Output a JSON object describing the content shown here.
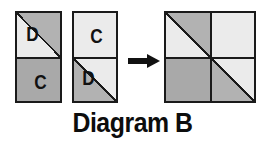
{
  "caption": {
    "text": "Diagram B"
  },
  "colors": {
    "outline": "#1a1a1a",
    "light": "#ebebeb",
    "mid_gray": "#b2b2b2",
    "dark_gray": "#a9a9a9",
    "background": "#ffffff",
    "text": "#111111"
  },
  "arrow": {
    "name": "right-arrow",
    "direction": "right"
  },
  "blocks": [
    {
      "id": "piece-1",
      "role": "input-left",
      "cells": [
        {
          "id": "piece-1-top",
          "position": "top",
          "pattern": "diagonal",
          "upper_left_shade": "light",
          "lower_right_shade": "mid_gray",
          "label": "D",
          "label_position": "upper-left"
        },
        {
          "id": "piece-1-bottom",
          "position": "bottom",
          "pattern": "solid",
          "shade": "dark_gray",
          "label": "C",
          "label_position": "center"
        }
      ]
    },
    {
      "id": "piece-2",
      "role": "input-right",
      "cells": [
        {
          "id": "piece-2-top",
          "position": "top",
          "pattern": "solid",
          "shade": "light",
          "label": "C",
          "label_position": "center"
        },
        {
          "id": "piece-2-bottom",
          "position": "bottom",
          "pattern": "diagonal",
          "upper_left_shade": "mid_gray",
          "lower_right_shade": "light",
          "label": "D",
          "label_position": "upper-left"
        }
      ]
    },
    {
      "id": "result-block",
      "role": "result",
      "cells": [
        {
          "id": "result-top-left",
          "position": "top-left",
          "pattern": "diagonal",
          "upper_left_shade": "light",
          "lower_right_shade": "mid_gray",
          "label": "",
          "label_position": "none"
        },
        {
          "id": "result-top-right",
          "position": "top-right",
          "pattern": "solid",
          "shade": "light",
          "label": "",
          "label_position": "none"
        },
        {
          "id": "result-bottom-left",
          "position": "bottom-left",
          "pattern": "solid",
          "shade": "dark_gray",
          "label": "",
          "label_position": "none"
        },
        {
          "id": "result-bottom-right",
          "position": "bottom-right",
          "pattern": "diagonal",
          "upper_left_shade": "mid_gray",
          "lower_right_shade": "light",
          "label": "",
          "label_position": "none"
        }
      ]
    }
  ]
}
